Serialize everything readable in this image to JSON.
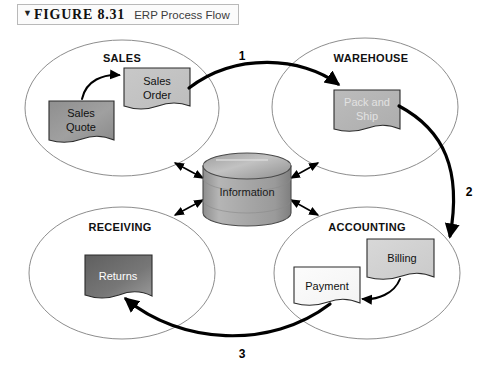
{
  "caption": {
    "marker_icon": "triangle-down-icon",
    "figure_label": "FIGURE 8.31",
    "title": "ERP Process Flow"
  },
  "diagram": {
    "type": "process-flow",
    "zones": [
      {
        "id": "sales",
        "label": "SALES",
        "cx": 122,
        "cy": 108,
        "rx": 97,
        "ry": 68
      },
      {
        "id": "warehouse",
        "label": "WAREHOUSE",
        "cx": 365,
        "cy": 107,
        "rx": 93,
        "ry": 69
      },
      {
        "id": "receiving",
        "label": "RECEIVING",
        "cx": 122,
        "cy": 273,
        "rx": 93,
        "ry": 66
      },
      {
        "id": "accounting",
        "label": "ACCOUNTING",
        "cx": 367,
        "cy": 273,
        "rx": 93,
        "ry": 66
      }
    ],
    "documents": [
      {
        "id": "sales-quote",
        "label": "Sales Quote",
        "lines": [
          "Sales",
          "Quote"
        ],
        "zone": "sales",
        "fill": "#9b9b9b",
        "text_color": "#111111"
      },
      {
        "id": "sales-order",
        "label": "Sales Order",
        "lines": [
          "Sales",
          "Order"
        ],
        "zone": "sales",
        "fill": "#c3c3c3",
        "text_color": "#111111"
      },
      {
        "id": "pack-ship",
        "label": "Pack and Ship",
        "lines": [
          "Pack and",
          "Ship"
        ],
        "zone": "warehouse",
        "fill": "#b7b7b7",
        "text_color": "#e2e2e2"
      },
      {
        "id": "returns",
        "label": "Returns",
        "lines": [
          "Returns"
        ],
        "zone": "receiving",
        "fill": "#6e6e6e",
        "text_color": "#ffffff"
      },
      {
        "id": "billing",
        "label": "Billing",
        "lines": [
          "Billing"
        ],
        "zone": "accounting",
        "fill": "#d2d2d2",
        "text_color": "#111111"
      },
      {
        "id": "payment",
        "label": "Payment",
        "lines": [
          "Payment"
        ],
        "zone": "accounting",
        "fill": "#fafafa",
        "text_color": "#111111"
      }
    ],
    "database": {
      "id": "information-store",
      "label": "Information",
      "fill": "#a9a9a9",
      "top_fill": "#bdbdbd"
    },
    "step_labels": [
      {
        "id": "step-1",
        "text": "1",
        "x": 242,
        "y": 56,
        "from": "sales-order",
        "to": "pack-ship"
      },
      {
        "id": "step-2",
        "text": "2",
        "x": 469,
        "y": 192,
        "from": "pack-ship",
        "to": "billing"
      },
      {
        "id": "step-3",
        "text": "3",
        "x": 242,
        "y": 354,
        "from": "payment",
        "to": "returns"
      }
    ],
    "internal_flows": [
      {
        "id": "quote-to-order",
        "from": "sales-quote",
        "to": "sales-order"
      },
      {
        "id": "billing-to-payment",
        "from": "billing",
        "to": "payment"
      }
    ],
    "database_links": [
      {
        "id": "db-link-sales",
        "zone": "sales",
        "direction": "bidirectional"
      },
      {
        "id": "db-link-warehouse",
        "zone": "warehouse",
        "direction": "bidirectional"
      },
      {
        "id": "db-link-receiving",
        "zone": "receiving",
        "direction": "bidirectional"
      },
      {
        "id": "db-link-accounting",
        "zone": "accounting",
        "direction": "bidirectional"
      }
    ],
    "colors": {
      "ellipse_stroke": "#8d8d8d",
      "flow_arrow": "#000000",
      "page_background": "#ffffff"
    }
  }
}
